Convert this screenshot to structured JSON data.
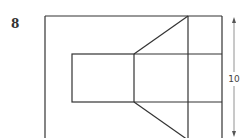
{
  "problem": {
    "number": "8"
  },
  "diagram": {
    "dimension_label": "10",
    "line_color": "#333333",
    "arrow_color": "#777777",
    "fill_color": "#ffffff"
  }
}
